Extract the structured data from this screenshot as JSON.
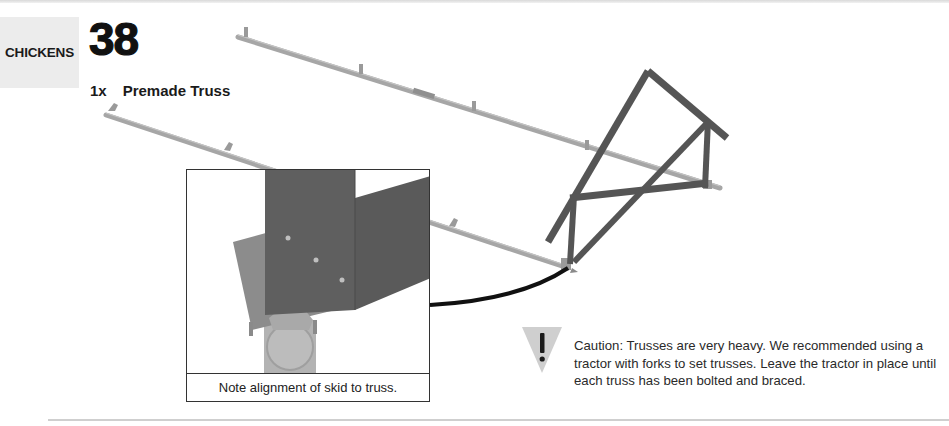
{
  "header": {
    "section_label": "CHICKENS",
    "step_number": "38"
  },
  "parts": [
    {
      "quantity": "1x",
      "name": "Premade Truss"
    }
  ],
  "illustration": {
    "description": "Premade truss being set on two parallel skids with brackets",
    "colors": {
      "skid": "#a6a6a6",
      "truss": "#555555",
      "inset_truss": "#5f5f5f",
      "inset_plate": "#8c8c8c",
      "inset_skid": "#b3b3b3",
      "callout_line": "#111111"
    }
  },
  "inset": {
    "caption": "Note alignment of skid to truss."
  },
  "caution": {
    "icon": "warning-triangle-icon",
    "text": "Caution: Trusses are very heavy. We recommended using a tractor with forks to set trusses. Leave the tractor in place until each truss has been bolted and braced."
  }
}
